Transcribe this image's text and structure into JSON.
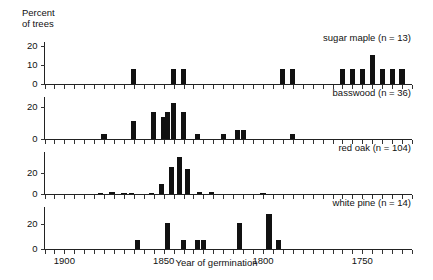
{
  "chart_data": {
    "type": "bar",
    "title": "",
    "xlabel": "Year of germination",
    "ylabel": "Percent\nof trees",
    "ylabel_lines": [
      "Percent",
      "of trees"
    ],
    "xlim": [
      1910,
      1725
    ],
    "x_reversed": true,
    "x_tick_interval": 5,
    "xticks_labeled": [
      1900,
      1850,
      1800,
      1750
    ],
    "bin_width_years": 5,
    "grid": false,
    "legend_position": "inside-top-right per panel",
    "panels": [
      {
        "name": "sugar maple",
        "legend": "sugar maple (n = 13)",
        "n": 13,
        "ylim": [
          0,
          22
        ],
        "yticks": [
          0,
          10,
          20
        ],
        "ytick_labels": [
          "0",
          "10",
          "20"
        ],
        "bars": [
          {
            "year": 1865,
            "value": 7.7
          },
          {
            "year": 1845,
            "value": 7.7
          },
          {
            "year": 1840,
            "value": 7.7
          },
          {
            "year": 1790,
            "value": 7.7
          },
          {
            "year": 1785,
            "value": 7.7
          },
          {
            "year": 1760,
            "value": 7.7
          },
          {
            "year": 1755,
            "value": 7.7
          },
          {
            "year": 1750,
            "value": 7.7
          },
          {
            "year": 1745,
            "value": 15.4
          },
          {
            "year": 1740,
            "value": 7.7
          },
          {
            "year": 1735,
            "value": 7.7
          },
          {
            "year": 1730,
            "value": 7.7
          }
        ]
      },
      {
        "name": "basswood",
        "legend": "basswood (n = 36)",
        "n": 36,
        "ylim": [
          0,
          26
        ],
        "yticks": [
          0,
          20
        ],
        "ytick_labels": [
          "0",
          "20"
        ],
        "bars": [
          {
            "year": 1880,
            "value": 2.8
          },
          {
            "year": 1865,
            "value": 11.1
          },
          {
            "year": 1855,
            "value": 16.7
          },
          {
            "year": 1850,
            "value": 13.9
          },
          {
            "year": 1848,
            "value": 16.7
          },
          {
            "year": 1845,
            "value": 22.2
          },
          {
            "year": 1840,
            "value": 16.7
          },
          {
            "year": 1833,
            "value": 2.8
          },
          {
            "year": 1820,
            "value": 2.8
          },
          {
            "year": 1813,
            "value": 5.6
          },
          {
            "year": 1810,
            "value": 5.6
          },
          {
            "year": 1785,
            "value": 2.8
          }
        ]
      },
      {
        "name": "red oak",
        "legend": "red oak (n = 104)",
        "n": 104,
        "ylim": [
          0,
          40
        ],
        "yticks": [
          0,
          20
        ],
        "ytick_labels": [
          "0",
          "20"
        ],
        "bars": [
          {
            "year": 1882,
            "value": 1.0
          },
          {
            "year": 1876,
            "value": 1.9
          },
          {
            "year": 1870,
            "value": 1.0
          },
          {
            "year": 1866,
            "value": 1.0
          },
          {
            "year": 1856,
            "value": 1.0
          },
          {
            "year": 1851,
            "value": 9.6
          },
          {
            "year": 1846,
            "value": 26.0
          },
          {
            "year": 1842,
            "value": 35.0
          },
          {
            "year": 1838,
            "value": 24.0
          },
          {
            "year": 1832,
            "value": 1.9
          },
          {
            "year": 1826,
            "value": 1.9
          },
          {
            "year": 1800,
            "value": 1.0
          }
        ]
      },
      {
        "name": "white pine",
        "legend": "white pine (n = 14)",
        "n": 14,
        "ylim": [
          0,
          34
        ],
        "yticks": [
          0,
          20
        ],
        "ytick_labels": [
          "0",
          "20"
        ],
        "bars": [
          {
            "year": 1863,
            "value": 7.1
          },
          {
            "year": 1848,
            "value": 21.4
          },
          {
            "year": 1840,
            "value": 7.1
          },
          {
            "year": 1833,
            "value": 7.1
          },
          {
            "year": 1830,
            "value": 7.1
          },
          {
            "year": 1812,
            "value": 21.4
          },
          {
            "year": 1797,
            "value": 28.6
          },
          {
            "year": 1792,
            "value": 7.1
          }
        ]
      }
    ]
  }
}
